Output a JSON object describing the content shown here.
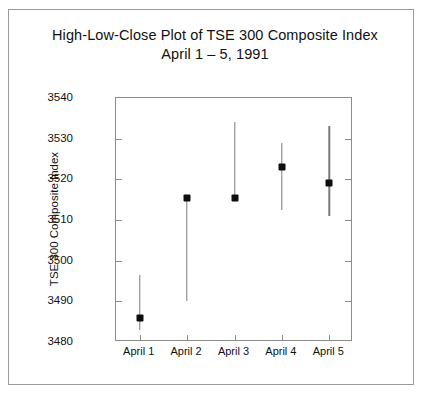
{
  "chart_data": {
    "type": "line",
    "title": "High-Low-Close Plot of TSE 300 Composite Index",
    "subtitle": "April 1 – 5, 1991",
    "xlabel": "",
    "ylabel": "TSE 300 Composite Index",
    "ylim": [
      3480,
      3540
    ],
    "yticks": [
      3480,
      3490,
      3500,
      3510,
      3520,
      3530,
      3540
    ],
    "ytick_labels": [
      "3480",
      "3490",
      "3500",
      "3510",
      "3520",
      "3530",
      "3540"
    ],
    "categories": [
      "April 1",
      "April 2",
      "April 3",
      "April 4",
      "April 5"
    ],
    "grid": false,
    "legend": null,
    "series": [
      {
        "name": "High",
        "values": [
          3496.5,
          3515.5,
          3534.0,
          3529.0,
          3533.0
        ]
      },
      {
        "name": "Low",
        "values": [
          3483.0,
          3490.0,
          3515.5,
          3512.5,
          3511.0
        ]
      },
      {
        "name": "Close",
        "values": [
          3485.8,
          3515.5,
          3515.5,
          3523.0,
          3519.0
        ]
      }
    ]
  },
  "figure": {
    "title_line1": "High-Low-Close Plot of TSE 300 Composite Index",
    "title_line2": "April 1 – 5, 1991",
    "y_axis_title": "TSE 300 Composite Index"
  },
  "colors": {
    "marker": "#0d0d0d",
    "bar": "#7a7a7a",
    "axis": "#8c8c8c",
    "frame": "#9a9a9a",
    "text": "#111111",
    "background": "#ffffff"
  }
}
